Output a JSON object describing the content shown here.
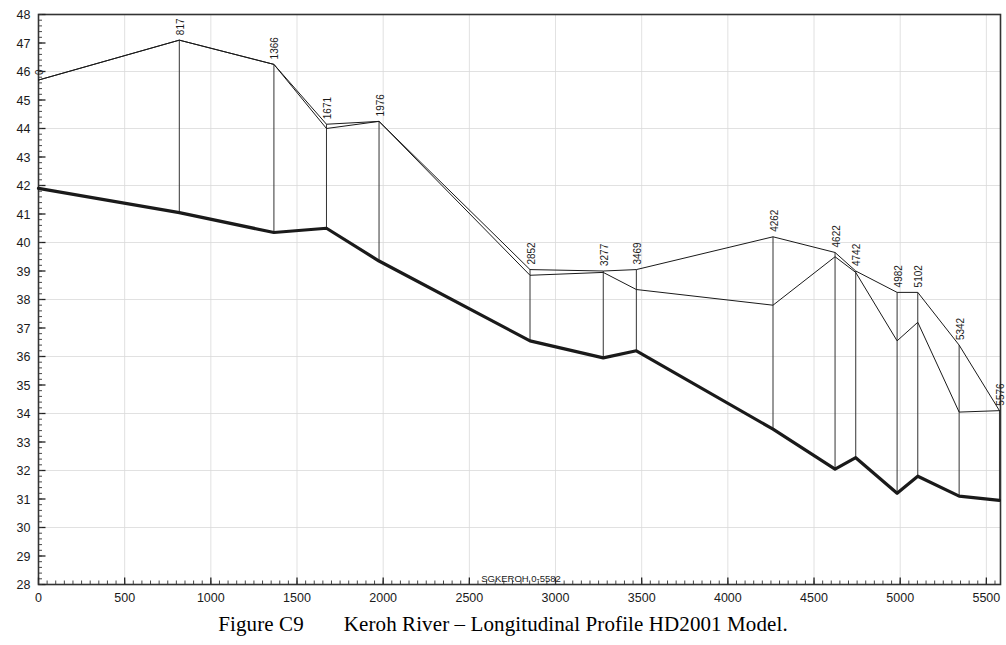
{
  "caption": {
    "figure_number": "Figure C9",
    "title": "Keroh River – Longitudinal Profile HD2001 Model."
  },
  "watermark": "SGKEROH 0-5582",
  "chart_data": {
    "type": "line",
    "title": "Keroh River – Longitudinal Profile HD2001 Model.",
    "xlabel": "",
    "ylabel": "",
    "xlim": [
      0,
      5582
    ],
    "ylim": [
      28,
      48
    ],
    "xticks": [
      0,
      500,
      1000,
      1500,
      2000,
      2500,
      3000,
      3500,
      4000,
      4500,
      5000,
      5500
    ],
    "yticks": [
      28,
      29,
      30,
      31,
      32,
      33,
      34,
      35,
      36,
      37,
      38,
      39,
      40,
      41,
      42,
      43,
      44,
      45,
      46,
      47,
      48
    ],
    "xtick_labels": [
      "0",
      "500",
      "1000",
      "1500",
      "2000",
      "2500",
      "3000",
      "3500",
      "4000",
      "4500",
      "5000",
      "5500"
    ],
    "ytick_labels": [
      "28",
      "29",
      "30",
      "31",
      "32",
      "33",
      "34",
      "35",
      "36",
      "37",
      "38",
      "39",
      "40",
      "41",
      "42",
      "43",
      "44",
      "45",
      "46",
      "47",
      "48"
    ],
    "minor_ticks": true,
    "grid": true,
    "legend": "none",
    "cross_section_labels": [
      "0",
      "817",
      "1366",
      "1671",
      "1976",
      "2852",
      "3277",
      "3469",
      "4262",
      "4622",
      "4742",
      "4982",
      "5102",
      "5342",
      "5576"
    ],
    "cross_section_chainages": [
      0,
      817,
      1366,
      1671,
      1976,
      2852,
      3277,
      3469,
      4262,
      4622,
      4742,
      4982,
      5102,
      5342,
      5576
    ],
    "series": [
      {
        "name": "left-bank-level",
        "style": "thin",
        "x": [
          0,
          817,
          1366,
          1671,
          1976,
          2852,
          3277,
          3469,
          4262,
          4622,
          4742,
          4982,
          5102,
          5342,
          5576
        ],
        "values": [
          45.7,
          47.1,
          46.25,
          44.15,
          44.25,
          39.05,
          39.0,
          39.05,
          40.2,
          39.65,
          39.0,
          38.25,
          38.25,
          36.4,
          34.1
        ]
      },
      {
        "name": "right-bank-level",
        "style": "thin",
        "x": [
          0,
          817,
          1366,
          1671,
          1976,
          2852,
          3277,
          3469,
          4262,
          4622,
          4742,
          4982,
          5102,
          5342,
          5576
        ],
        "values": [
          45.7,
          47.1,
          46.25,
          44.0,
          44.25,
          38.85,
          38.95,
          38.35,
          37.8,
          39.5,
          38.95,
          36.55,
          37.2,
          34.05,
          34.1
        ]
      },
      {
        "name": "bed-level",
        "style": "thick",
        "x": [
          0,
          817,
          1366,
          1671,
          1976,
          2852,
          3277,
          3469,
          4262,
          4622,
          4742,
          4982,
          5102,
          5342,
          5576
        ],
        "values": [
          41.9,
          41.05,
          40.35,
          40.5,
          39.35,
          36.55,
          35.95,
          36.2,
          33.45,
          32.05,
          32.45,
          31.2,
          31.8,
          31.1,
          30.95
        ]
      }
    ]
  },
  "axes": {
    "x_axis_name": "chainage-axis",
    "y_axis_name": "elevation-axis"
  }
}
